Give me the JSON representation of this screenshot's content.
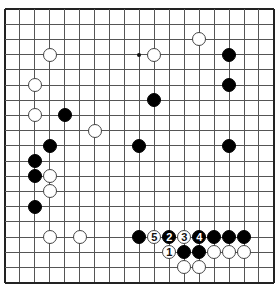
{
  "board": {
    "size": 19,
    "origin_x": 5,
    "origin_y": 9,
    "spacing_x": 14.94,
    "spacing_y": 15.2,
    "colors": {
      "line": "#555555",
      "edge": "#222222",
      "black": "#000000",
      "white": "#ffffff"
    },
    "hoshi": [
      [
        9,
        3
      ]
    ],
    "stones": [
      {
        "color": "white",
        "col": 3,
        "row": 3,
        "label": ""
      },
      {
        "color": "white",
        "col": 10,
        "row": 3,
        "label": ""
      },
      {
        "color": "white",
        "col": 13,
        "row": 2,
        "label": ""
      },
      {
        "color": "black",
        "col": 15,
        "row": 3,
        "label": ""
      },
      {
        "color": "white",
        "col": 2,
        "row": 5,
        "label": ""
      },
      {
        "color": "black",
        "col": 15,
        "row": 5,
        "label": ""
      },
      {
        "color": "black",
        "col": 10,
        "row": 6,
        "label": ""
      },
      {
        "color": "white",
        "col": 2,
        "row": 7,
        "label": ""
      },
      {
        "color": "black",
        "col": 4,
        "row": 7,
        "label": ""
      },
      {
        "color": "white",
        "col": 6,
        "row": 8,
        "label": ""
      },
      {
        "color": "black",
        "col": 3,
        "row": 9,
        "label": ""
      },
      {
        "color": "black",
        "col": 9,
        "row": 9,
        "label": ""
      },
      {
        "color": "black",
        "col": 15,
        "row": 9,
        "label": ""
      },
      {
        "color": "black",
        "col": 2,
        "row": 10,
        "label": ""
      },
      {
        "color": "black",
        "col": 2,
        "row": 11,
        "label": ""
      },
      {
        "color": "white",
        "col": 3,
        "row": 11,
        "label": ""
      },
      {
        "color": "white",
        "col": 3,
        "row": 12,
        "label": ""
      },
      {
        "color": "black",
        "col": 2,
        "row": 13,
        "label": ""
      },
      {
        "color": "white",
        "col": 3,
        "row": 15,
        "label": ""
      },
      {
        "color": "white",
        "col": 5,
        "row": 15,
        "label": ""
      },
      {
        "color": "black",
        "col": 9,
        "row": 15,
        "label": ""
      },
      {
        "color": "white",
        "col": 10,
        "row": 15,
        "label": "5"
      },
      {
        "color": "black",
        "col": 11,
        "row": 15,
        "label": "2"
      },
      {
        "color": "white",
        "col": 12,
        "row": 15,
        "label": "3"
      },
      {
        "color": "black",
        "col": 13,
        "row": 15,
        "label": "4"
      },
      {
        "color": "black",
        "col": 14,
        "row": 15,
        "label": ""
      },
      {
        "color": "black",
        "col": 15,
        "row": 15,
        "label": ""
      },
      {
        "color": "black",
        "col": 16,
        "row": 15,
        "label": ""
      },
      {
        "color": "white",
        "col": 11,
        "row": 16,
        "label": "1"
      },
      {
        "color": "black",
        "col": 12,
        "row": 16,
        "label": ""
      },
      {
        "color": "black",
        "col": 13,
        "row": 16,
        "label": ""
      },
      {
        "color": "white",
        "col": 14,
        "row": 16,
        "label": ""
      },
      {
        "color": "white",
        "col": 15,
        "row": 16,
        "label": ""
      },
      {
        "color": "white",
        "col": 16,
        "row": 16,
        "label": ""
      },
      {
        "color": "white",
        "col": 12,
        "row": 17,
        "label": ""
      },
      {
        "color": "white",
        "col": 13,
        "row": 17,
        "label": ""
      }
    ]
  }
}
